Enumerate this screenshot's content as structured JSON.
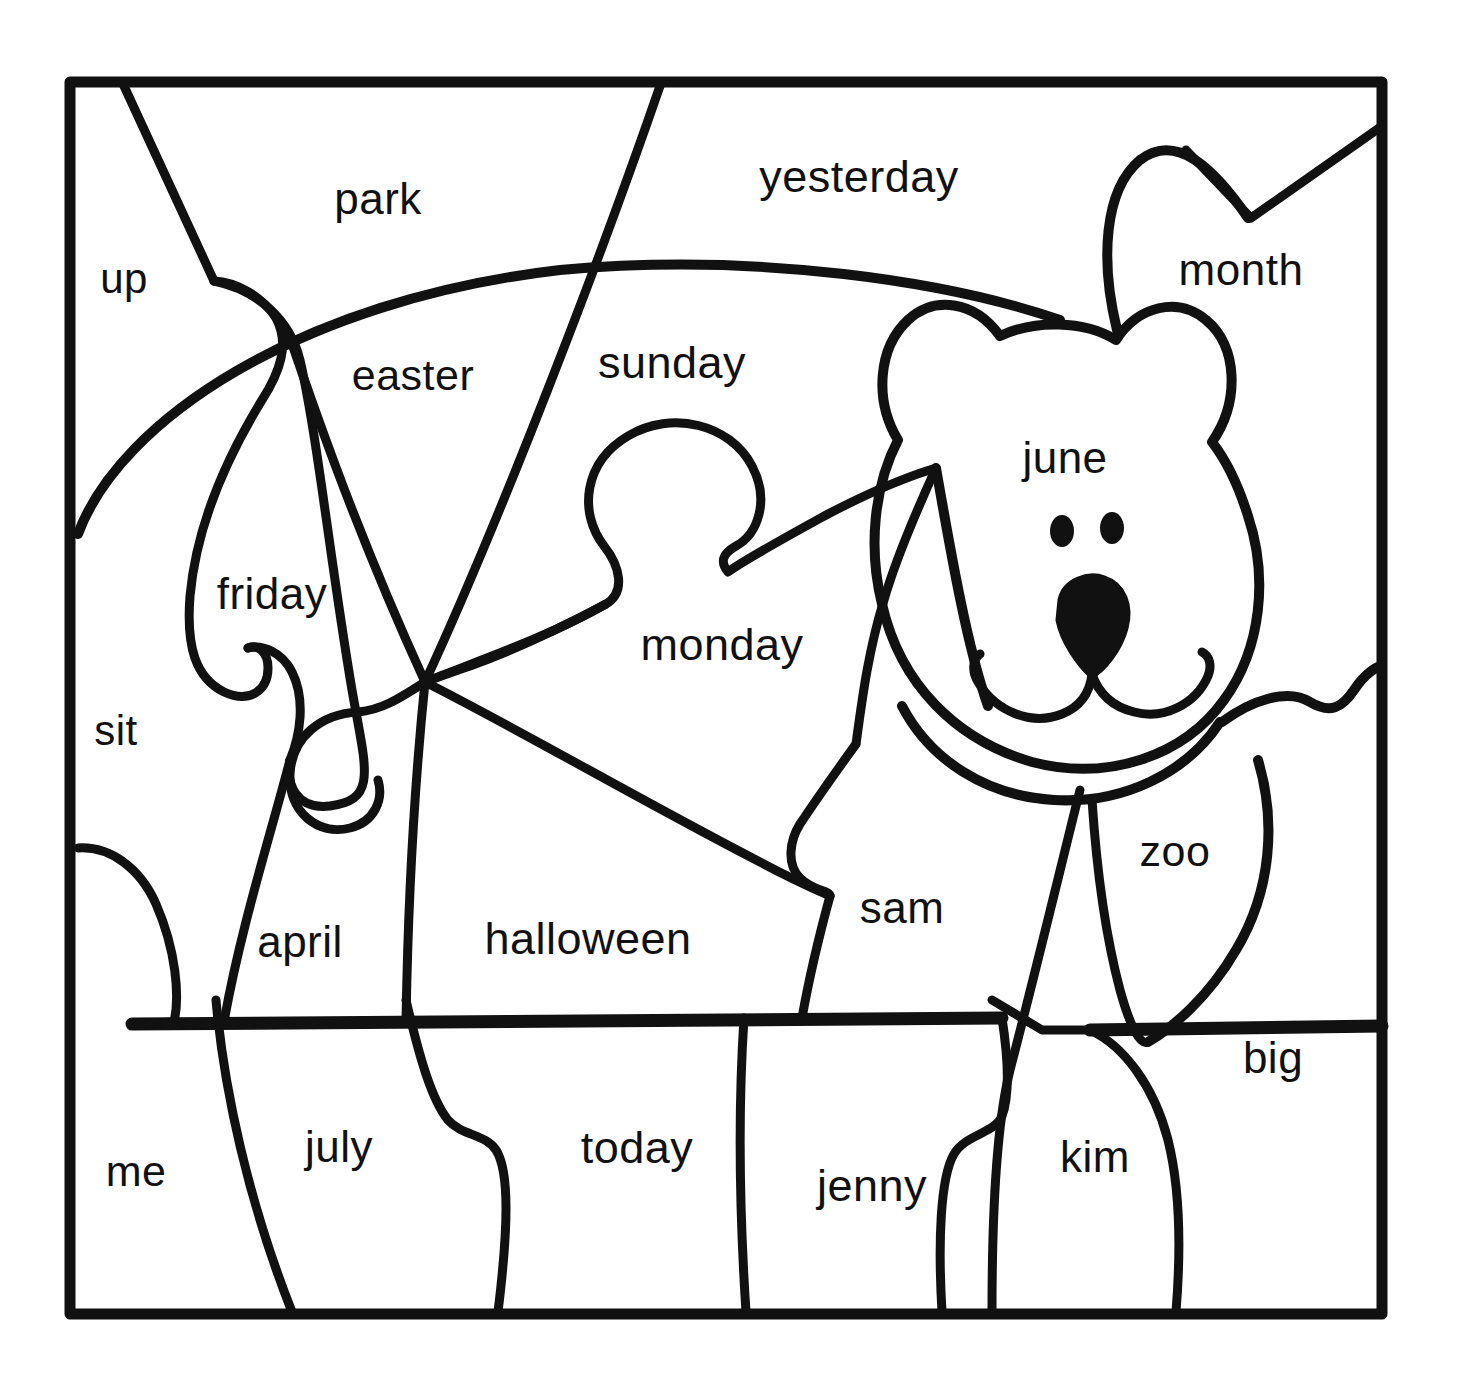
{
  "worksheet": {
    "kind": "coloring-puzzle-worksheet",
    "subject": "teddy-bear-sight-word-puzzle",
    "ink_color": "#111111",
    "paper_color": "#ffffff",
    "frame": {
      "stroke": "#111111",
      "stroke_width": 9,
      "x": 67,
      "y": 79,
      "width": 1316,
      "height": 1236
    }
  },
  "words": [
    {
      "text": "up",
      "x": 124,
      "y": 279,
      "size": 42
    },
    {
      "text": "park",
      "x": 378,
      "y": 199,
      "size": 44
    },
    {
      "text": "yesterday",
      "x": 859,
      "y": 177,
      "size": 45
    },
    {
      "text": "month",
      "x": 1241,
      "y": 270,
      "size": 44
    },
    {
      "text": "easter",
      "x": 413,
      "y": 375,
      "size": 43
    },
    {
      "text": "sunday",
      "x": 672,
      "y": 363,
      "size": 45
    },
    {
      "text": "june",
      "x": 1065,
      "y": 458,
      "size": 44
    },
    {
      "text": "friday",
      "x": 272,
      "y": 594,
      "size": 44
    },
    {
      "text": "monday",
      "x": 722,
      "y": 645,
      "size": 45
    },
    {
      "text": "sit",
      "x": 116,
      "y": 731,
      "size": 42
    },
    {
      "text": "zoo",
      "x": 1175,
      "y": 851,
      "size": 43
    },
    {
      "text": "sam",
      "x": 902,
      "y": 908,
      "size": 44
    },
    {
      "text": "april",
      "x": 300,
      "y": 942,
      "size": 44
    },
    {
      "text": "halloween",
      "x": 588,
      "y": 939,
      "size": 45
    },
    {
      "text": "big",
      "x": 1273,
      "y": 1058,
      "size": 44
    },
    {
      "text": "july",
      "x": 339,
      "y": 1147,
      "size": 44
    },
    {
      "text": "today",
      "x": 637,
      "y": 1148,
      "size": 45
    },
    {
      "text": "kim",
      "x": 1095,
      "y": 1157,
      "size": 44
    },
    {
      "text": "me",
      "x": 136,
      "y": 1171,
      "size": 43
    },
    {
      "text": "jenny",
      "x": 872,
      "y": 1186,
      "size": 45
    }
  ],
  "bear": {
    "name": "teddy-bear",
    "features": [
      "left-ear",
      "right-ear",
      "head",
      "left-eye",
      "right-eye",
      "nose",
      "muzzle",
      "smile",
      "body",
      "left-arm",
      "right-arm",
      "antenna-tuft"
    ]
  }
}
